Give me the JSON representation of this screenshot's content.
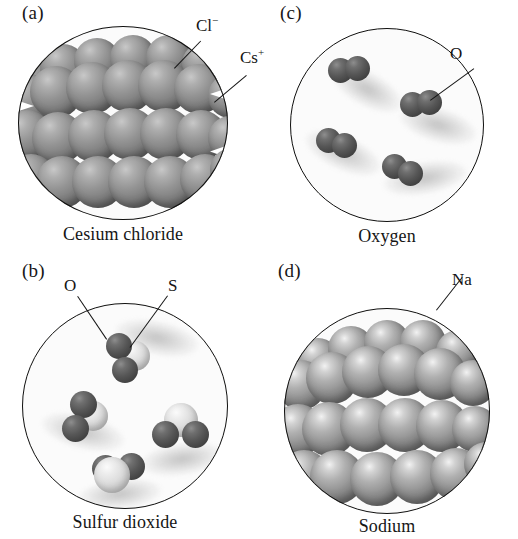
{
  "figure": {
    "background": "#ffffff",
    "ink": "#141414"
  },
  "panels": [
    {
      "tag": "(a)",
      "caption": "Cesium chloride",
      "substance": "cesium chloride",
      "type": "ionic-crystal",
      "labels": [
        {
          "name": "chloride-ion-label",
          "text": "Cl",
          "charge": "−"
        },
        {
          "name": "cesium-ion-label",
          "text": "Cs",
          "charge": "+"
        }
      ]
    },
    {
      "tag": "(b)",
      "caption": "Sulfur dioxide",
      "substance": "sulfur dioxide",
      "type": "molecular-gas",
      "molecule_count": 4,
      "labels": [
        {
          "name": "oxygen-atom-label",
          "text": "O",
          "charge": ""
        },
        {
          "name": "sulfur-atom-label",
          "text": "S",
          "charge": ""
        }
      ]
    },
    {
      "tag": "(c)",
      "caption": "Oxygen",
      "substance": "oxygen",
      "type": "diatomic-gas",
      "molecule_count": 4,
      "labels": [
        {
          "name": "oxygen-molecule-label",
          "text": "O",
          "charge": ""
        }
      ]
    },
    {
      "tag": "(d)",
      "caption": "Sodium",
      "substance": "sodium",
      "type": "metallic-solid",
      "labels": [
        {
          "name": "sodium-atom-label",
          "text": "Na",
          "charge": ""
        }
      ]
    }
  ],
  "colors": {
    "dark_atom": "#4a4a4a",
    "light_atom": "#e4e4e4",
    "metal_atom": "#9a9a9a",
    "outline": "#10100f",
    "page": "#ffffff"
  }
}
